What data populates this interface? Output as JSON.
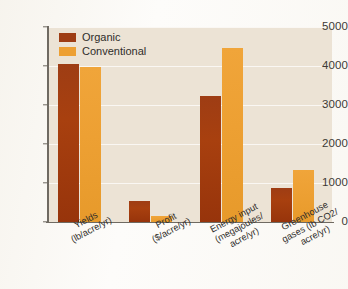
{
  "chart_data": {
    "type": "bar",
    "title": "",
    "subtitle": "",
    "xlabel": "",
    "ylabel": "",
    "ylim": [
      0,
      5000
    ],
    "yticks": [
      0,
      1000,
      2000,
      3000,
      4000,
      5000
    ],
    "ytick_labels": [
      "0",
      "1000",
      "2000",
      "3000",
      "4000",
      "5000"
    ],
    "grid": true,
    "grid_axis": "y",
    "legend_position": "top-left",
    "categories": [
      "Yields (lb/acre/yr)",
      "Profit ($/acre/yr)",
      "Energy input (megajoules/acre/yr)",
      "Greenhouse gases (lb CO2/acre/yr)"
    ],
    "category_lines": [
      [
        "Yields",
        "(lb/acre/yr)"
      ],
      [
        "Profit",
        "($/acre/yr)"
      ],
      [
        "Energy input",
        "(megajoules/",
        "acre/yr)"
      ],
      [
        "Greenhouse",
        "gases (lb CO2/",
        "acre/yr)"
      ]
    ],
    "series": [
      {
        "name": "Organic",
        "color": "#9e3d14",
        "values": [
          4050,
          540,
          3230,
          870
        ]
      },
      {
        "name": "Conventional",
        "color": "#eda033",
        "values": [
          3980,
          160,
          4460,
          1330
        ]
      }
    ]
  },
  "colors": {
    "plot_background": "#ece3d5",
    "page_background": "#fdfcfa",
    "axis": "#6f6a62",
    "gridline": "#ffffff",
    "organic": "#9e3d14",
    "conventional": "#eda033",
    "text": "#2f2d2a"
  }
}
